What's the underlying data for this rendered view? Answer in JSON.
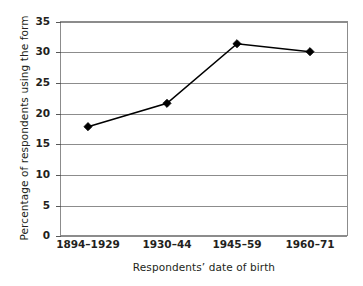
{
  "chart_data": {
    "type": "line",
    "title": "",
    "xlabel": "Respondents’ date of birth",
    "ylabel": "Percentage of respondents using the form",
    "categories": [
      "1894–1929",
      "1930–44",
      "1945–59",
      "1960–71"
    ],
    "values": [
      17.8,
      21.6,
      31.3,
      30.0
    ],
    "series": [
      {
        "name": "Percentage of respondents using the form",
        "values": [
          17.8,
          21.6,
          31.3,
          30.0
        ]
      }
    ],
    "ylim": [
      0,
      35
    ],
    "yticks": [
      0,
      5,
      10,
      15,
      20,
      25,
      30,
      35
    ],
    "ytick_labels": [
      "0",
      "5",
      "10",
      "15",
      "20",
      "25",
      "30",
      "35"
    ],
    "grid": "horizontal",
    "legend": "none",
    "marker": "diamond",
    "line_color": "#000000",
    "grid_color": "#8c8c8c",
    "text_color": "#231f20"
  },
  "axes": {
    "y_title": "Percentage of respondents using the form",
    "x_title": "Respondents’ date of birth",
    "y_tick_labels": [
      "35",
      "30",
      "25",
      "20",
      "15",
      "10",
      "5",
      "0"
    ],
    "x_tick_labels": [
      "1894–1929",
      "1930–44",
      "1945–59",
      "1960–71"
    ]
  }
}
